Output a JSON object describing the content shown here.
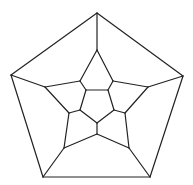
{
  "diagram": {
    "type": "dodecahedron-schlegel-graph",
    "stroke": "#222222",
    "background": "#ffffff",
    "vertices": {
      "o0": [
        97,
        13
      ],
      "o1": [
        183,
        76
      ],
      "o2": [
        150,
        177
      ],
      "o3": [
        43,
        177
      ],
      "o4": [
        11,
        75
      ],
      "m0": [
        97,
        50
      ],
      "m1": [
        113,
        81
      ],
      "m2": [
        148,
        87
      ],
      "m3": [
        125,
        113
      ],
      "m4": [
        129,
        148
      ],
      "m5": [
        97,
        134
      ],
      "m6": [
        64,
        148
      ],
      "m7": [
        69,
        113
      ],
      "m8": [
        45,
        87
      ],
      "m9": [
        80,
        81
      ],
      "i0": [
        86,
        90
      ],
      "i1": [
        108,
        90
      ],
      "i2": [
        114,
        110
      ],
      "i3": [
        97,
        123
      ],
      "i4": [
        80,
        110
      ]
    },
    "edges": [
      [
        "o0",
        "o1"
      ],
      [
        "o1",
        "o2"
      ],
      [
        "o2",
        "o3"
      ],
      [
        "o3",
        "o4"
      ],
      [
        "o4",
        "o0"
      ],
      [
        "o0",
        "m0"
      ],
      [
        "o1",
        "m2"
      ],
      [
        "o2",
        "m4"
      ],
      [
        "o3",
        "m6"
      ],
      [
        "o4",
        "m8"
      ],
      [
        "m0",
        "m1"
      ],
      [
        "m1",
        "m2"
      ],
      [
        "m2",
        "m3"
      ],
      [
        "m3",
        "m4"
      ],
      [
        "m4",
        "m5"
      ],
      [
        "m5",
        "m6"
      ],
      [
        "m6",
        "m7"
      ],
      [
        "m7",
        "m8"
      ],
      [
        "m8",
        "m9"
      ],
      [
        "m9",
        "m0"
      ],
      [
        "m1",
        "i1"
      ],
      [
        "m3",
        "i2"
      ],
      [
        "m5",
        "i3"
      ],
      [
        "m7",
        "i4"
      ],
      [
        "m9",
        "i0"
      ],
      [
        "i0",
        "i1"
      ],
      [
        "i1",
        "i2"
      ],
      [
        "i2",
        "i3"
      ],
      [
        "i3",
        "i4"
      ],
      [
        "i4",
        "i0"
      ]
    ]
  }
}
